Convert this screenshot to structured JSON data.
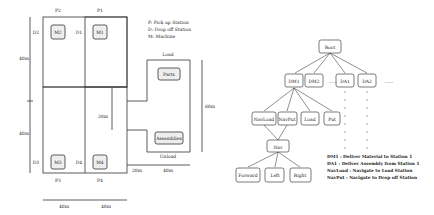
{
  "layout": {
    "stations_top": [
      {
        "pick": "P2",
        "drop": "D2",
        "machine": "M2"
      },
      {
        "pick": "P1",
        "drop": "D1",
        "machine": "M1"
      }
    ],
    "stations_bottom": [
      {
        "pick": "P3",
        "drop": "D3",
        "machine": "M3"
      },
      {
        "pick": "P4",
        "drop": "D4",
        "machine": "M4"
      }
    ],
    "legend": [
      "P: Pick up Station",
      "D: Drop off Station",
      "M: Machine"
    ],
    "parts_label": "Parts",
    "assemblies_label": "Assemblies",
    "load_label": "Load",
    "unload_label": "Unload",
    "dims": {
      "left_upper": "40m",
      "left_lower": "40m",
      "right_height": "60m",
      "inner": "20m",
      "bottom_gap": "20m",
      "bottom_right": "40m",
      "bottom_left1": "40m",
      "bottom_left2": "40m"
    }
  },
  "tree": {
    "root": "Root",
    "level1": [
      "DM1",
      "DM2",
      "DA1",
      "DA2"
    ],
    "ellipsis": "......",
    "level2": [
      "NavLoad",
      "NavPut",
      "Load",
      "Put"
    ],
    "nav": "Nav",
    "level3": [
      "Forward",
      "Left",
      "Right"
    ],
    "legend": [
      "DM1 : Deliver Material to Station 1",
      "DA1 : Deliver Assembly from Station 1",
      "NavLoad : Navigate to Load Station",
      "NavPut : Navigate to Drop off Station"
    ]
  }
}
